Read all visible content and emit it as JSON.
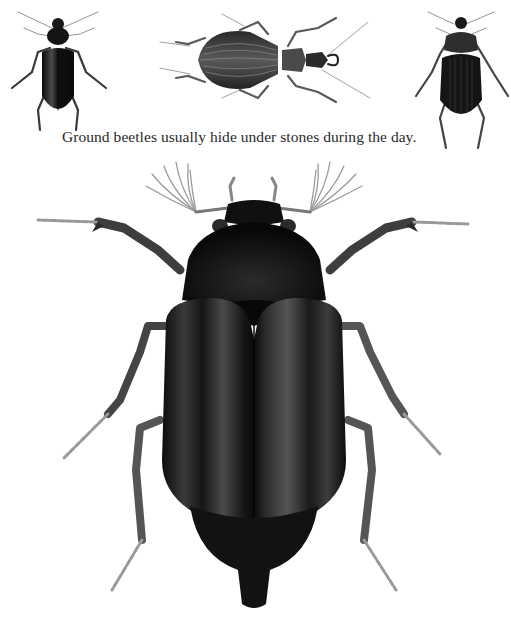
{
  "caption": "Ground beetles usually hide under stones during the day.",
  "illustrations": [
    {
      "name": "ground-beetle-small-left",
      "position": "top-left",
      "orientation": "head-up"
    },
    {
      "name": "ground-beetle-ribbed",
      "position": "top-center",
      "orientation": "head-right"
    },
    {
      "name": "ground-beetle-small-right",
      "position": "top-right",
      "orientation": "head-up"
    },
    {
      "name": "large-beetle",
      "position": "center",
      "orientation": "head-up",
      "antennae": "fan-shaped"
    }
  ],
  "colors": {
    "background": "#ffffff",
    "beetle_body": "#141414",
    "beetle_highlight": "#6a6a6a",
    "legs": "#555555",
    "tarsi": "#9a9a9a",
    "caption_text": "#2a2a2a"
  }
}
